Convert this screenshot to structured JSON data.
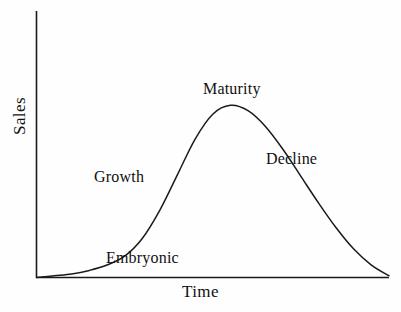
{
  "chart_data": {
    "type": "line",
    "title": "",
    "xlabel": "Time",
    "ylabel": "Sales",
    "grid": false,
    "legend": false,
    "axis_style": "L-shaped open axes, no tick marks, no tick labels",
    "xlim": [
      0,
      100
    ],
    "ylim": [
      0,
      100
    ],
    "series": [
      {
        "name": "Sales",
        "x": [
          0,
          5,
          10,
          15,
          20,
          25,
          30,
          35,
          40,
          45,
          50,
          55,
          60,
          65,
          70,
          75,
          80,
          85,
          90,
          95,
          100
        ],
        "y": [
          0,
          1,
          2,
          4,
          7,
          12,
          22,
          38,
          58,
          78,
          92,
          97,
          94,
          85,
          72,
          57,
          42,
          28,
          16,
          7,
          1
        ]
      }
    ],
    "annotations": [
      {
        "text": "Embryonic",
        "stage": 1,
        "x": 20,
        "y": 8
      },
      {
        "text": "Growth",
        "stage": 2,
        "x": 33,
        "y": 43
      },
      {
        "text": "Maturity",
        "stage": 3,
        "x": 55,
        "y": 99
      },
      {
        "text": "Decline",
        "stage": 4,
        "x": 76,
        "y": 57
      }
    ]
  },
  "axes": {
    "y_label": "Sales",
    "x_label": "Time"
  },
  "labels": {
    "embryonic": "Embryonic",
    "growth": "Growth",
    "maturity": "Maturity",
    "decline": "Decline"
  },
  "colors": {
    "background": "#fefefe",
    "ink": "#101010",
    "curve": "#1a1a1a",
    "axis": "#1a1a1a"
  }
}
